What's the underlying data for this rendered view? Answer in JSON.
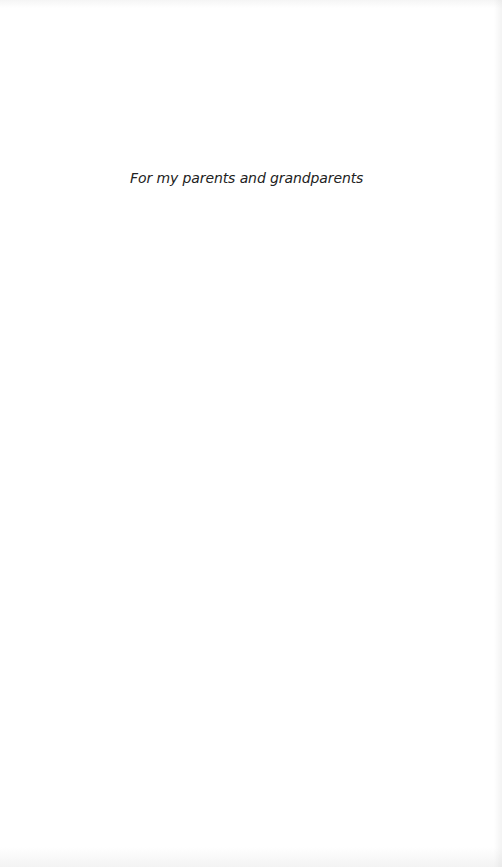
{
  "page": {
    "type": "dedication",
    "background_color": "#ffffff",
    "text_color": "#222222"
  },
  "dedication": {
    "text": "For my parents and grandparents"
  }
}
